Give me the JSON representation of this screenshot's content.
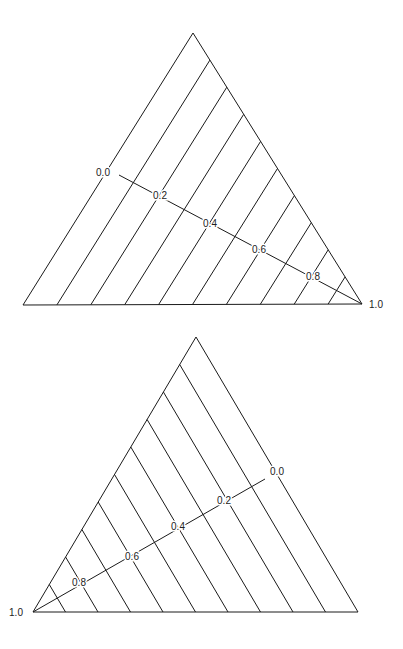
{
  "figure": {
    "type": "ternary-diagram-isolines",
    "panels": [
      {
        "id": "top",
        "description": "Triangle with isolines parallel to left edge; axis from left edge to bottom-right vertex",
        "vertices": {
          "apex": [
            193,
            33
          ],
          "bottom_left": [
            23,
            305
          ],
          "bottom_right": [
            362,
            304
          ]
        },
        "isoline_direction": "parallel-to-left-edge",
        "isoline_count": 9,
        "axis": {
          "from": [
            119,
            175
          ],
          "to": [
            362,
            304
          ]
        },
        "tick_labels": [
          {
            "text": "0.0",
            "x": 103,
            "y": 176
          },
          {
            "text": "0.2",
            "x": 160,
            "y": 199
          },
          {
            "text": "0.4",
            "x": 210,
            "y": 227
          },
          {
            "text": "0.6",
            "x": 259,
            "y": 253
          },
          {
            "text": "0.8",
            "x": 313,
            "y": 280
          },
          {
            "text": "1.0",
            "x": 376,
            "y": 308
          }
        ]
      },
      {
        "id": "bottom",
        "description": "Triangle with isolines parallel to right edge; axis from right edge to bottom-left vertex",
        "vertices": {
          "apex": [
            196,
            337
          ],
          "bottom_left": [
            33,
            612
          ],
          "bottom_right": [
            358,
            612
          ]
        },
        "isoline_direction": "parallel-to-right-edge",
        "isoline_count": 9,
        "axis": {
          "from": [
            265,
            479
          ],
          "to": [
            33,
            612
          ]
        },
        "tick_labels": [
          {
            "text": "0.0",
            "x": 277,
            "y": 475
          },
          {
            "text": "0.2",
            "x": 224,
            "y": 504
          },
          {
            "text": "0.4",
            "x": 178,
            "y": 530
          },
          {
            "text": "0.6",
            "x": 132,
            "y": 560
          },
          {
            "text": "0.8",
            "x": 79,
            "y": 586
          },
          {
            "text": "1.0",
            "x": 16,
            "y": 616
          }
        ]
      }
    ]
  },
  "colors": {
    "line": "#1a1a1a",
    "text": "#222222",
    "background": "#ffffff"
  }
}
